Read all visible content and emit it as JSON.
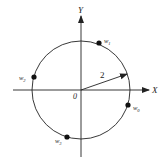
{
  "diagram": {
    "type": "complex-plane-roots",
    "axes": {
      "x_label": "X",
      "y_label": "Y",
      "origin_label": "0"
    },
    "circle": {
      "radius_label": "2"
    },
    "points": [
      {
        "name": "w0",
        "base": "w",
        "sub": "0"
      },
      {
        "name": "w1",
        "base": "w",
        "sub": "1"
      },
      {
        "name": "w2",
        "base": "w",
        "sub": "2"
      },
      {
        "name": "w3",
        "base": "w",
        "sub": "3"
      }
    ],
    "colors": {
      "stroke": "#222222",
      "background": "#ffffff"
    }
  }
}
